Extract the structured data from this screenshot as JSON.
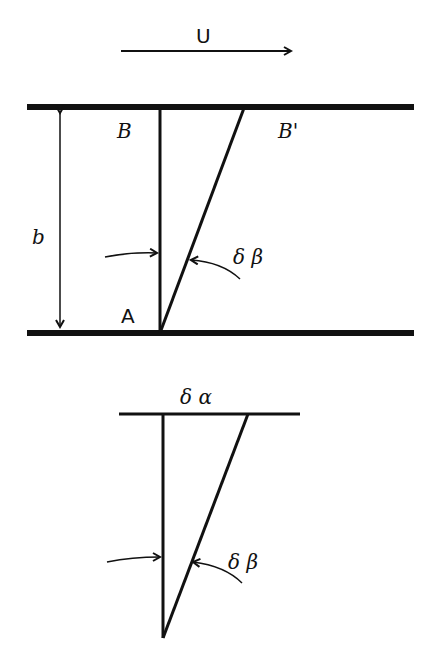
{
  "diagram": {
    "top_figure": {
      "velocity_label": "U",
      "point_B": "B",
      "point_B_prime": "B'",
      "point_A": "A",
      "gap_label": "b",
      "angle_label": "δ β"
    },
    "bottom_figure": {
      "top_label": "δ α",
      "angle_label": "δ β"
    },
    "colors": {
      "stroke": "#111111",
      "background": "#ffffff"
    }
  }
}
